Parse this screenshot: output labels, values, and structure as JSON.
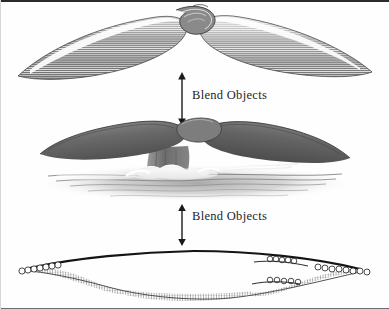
{
  "figure": {
    "background_color": "#fefefe",
    "frame_color": "#2b2b2b",
    "ink_color": "#1e1e1e",
    "width": 390,
    "height": 309
  },
  "labels": {
    "top": "Blend Objects",
    "bottom": "Blend Objects"
  },
  "arrows": {
    "top": {
      "name": "double-headed-arrow",
      "direction": "both",
      "connects_from": "blended-strokes-artwork",
      "connects_to": "rendered-whale-tail-artwork"
    },
    "bottom": {
      "name": "double-headed-arrow",
      "direction": "both",
      "connects_from": "rendered-whale-tail-artwork",
      "connects_to": "source-paths-artwork"
    }
  },
  "artworks": [
    {
      "id": "blended-strokes-artwork",
      "caption": "Whale tail rendered as blended line strokes",
      "position": "top"
    },
    {
      "id": "rendered-whale-tail-artwork",
      "caption": "Finished whale tail breaching the water surface",
      "position": "middle"
    },
    {
      "id": "source-paths-artwork",
      "caption": "Original key paths with anchor points before blending",
      "position": "bottom"
    }
  ]
}
